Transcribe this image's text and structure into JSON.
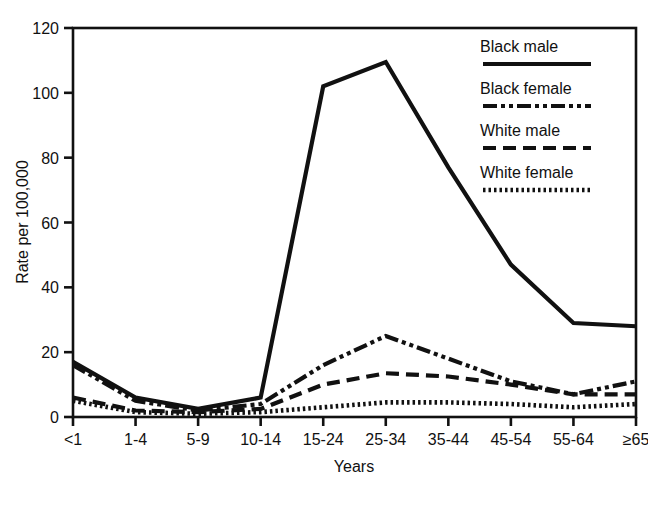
{
  "chart_data": {
    "type": "line",
    "title": "",
    "subtitle": "",
    "xlabel": "Years",
    "ylabel": "Rate per 100,000",
    "categories": [
      "<1",
      "1-4",
      "5-9",
      "10-14",
      "15-24",
      "25-34",
      "35-44",
      "45-54",
      "55-64",
      "≥65"
    ],
    "xtick_labels": [
      "<1",
      "1-4",
      "5-9",
      "10-14",
      "15-24",
      "25-34",
      "35-44",
      "45-54",
      "55-64",
      "≥65"
    ],
    "ytick_labels": [
      "0",
      "20",
      "40",
      "60",
      "80",
      "100",
      "120"
    ],
    "ytick_values": [
      0,
      20,
      40,
      60,
      80,
      100,
      120
    ],
    "ylim": [
      0,
      120
    ],
    "grid": false,
    "legend_position": "top-right",
    "series": [
      {
        "name": "Black male",
        "style": "solid",
        "color": "#111111",
        "values": [
          17,
          6,
          2.5,
          6,
          102,
          109.5,
          77,
          47,
          29,
          28
        ]
      },
      {
        "name": "Black female",
        "style": "dash-dot-dot",
        "color": "#111111",
        "values": [
          16,
          5,
          2,
          4,
          16,
          25,
          18,
          11,
          7,
          11
        ]
      },
      {
        "name": "White male",
        "style": "dashed",
        "color": "#111111",
        "values": [
          6,
          2,
          1.5,
          2.5,
          10,
          13.5,
          12.5,
          10,
          7,
          7
        ]
      },
      {
        "name": "White female",
        "style": "dotted",
        "color": "#111111",
        "values": [
          5,
          1.5,
          1,
          1.5,
          3,
          4.5,
          4.5,
          4,
          3,
          4
        ]
      }
    ]
  },
  "axes": {
    "y_axis_title": "Rate per 100,000",
    "x_axis_title": "Years"
  },
  "legend": {
    "entries": [
      {
        "label": "Black male",
        "swatch": "solid-line-swatch"
      },
      {
        "label": "Black female",
        "swatch": "dash-dot-dot-line-swatch"
      },
      {
        "label": "White male",
        "swatch": "dashed-line-swatch"
      },
      {
        "label": "White female",
        "swatch": "dotted-line-swatch"
      }
    ]
  }
}
